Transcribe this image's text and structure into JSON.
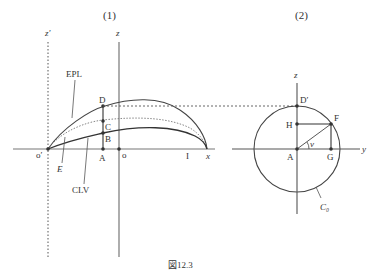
{
  "panels": [
    {
      "id": "panel-1",
      "title": "(1)",
      "axes": {
        "x": "x",
        "z": "z",
        "z_prime": "z′",
        "origin": "o",
        "origin_prime": "o′"
      },
      "curves": [
        "EPL",
        "CLV"
      ],
      "region_label": "E",
      "points": [
        "A",
        "B",
        "C",
        "D",
        "I"
      ]
    },
    {
      "id": "panel-2",
      "title": "(2)",
      "axes": {
        "y": "y",
        "z": "z"
      },
      "circle_label": "C₀",
      "angle_label": "ν",
      "points": [
        "A",
        "D′",
        "F",
        "G",
        "H"
      ]
    }
  ],
  "caption": "図12.3"
}
